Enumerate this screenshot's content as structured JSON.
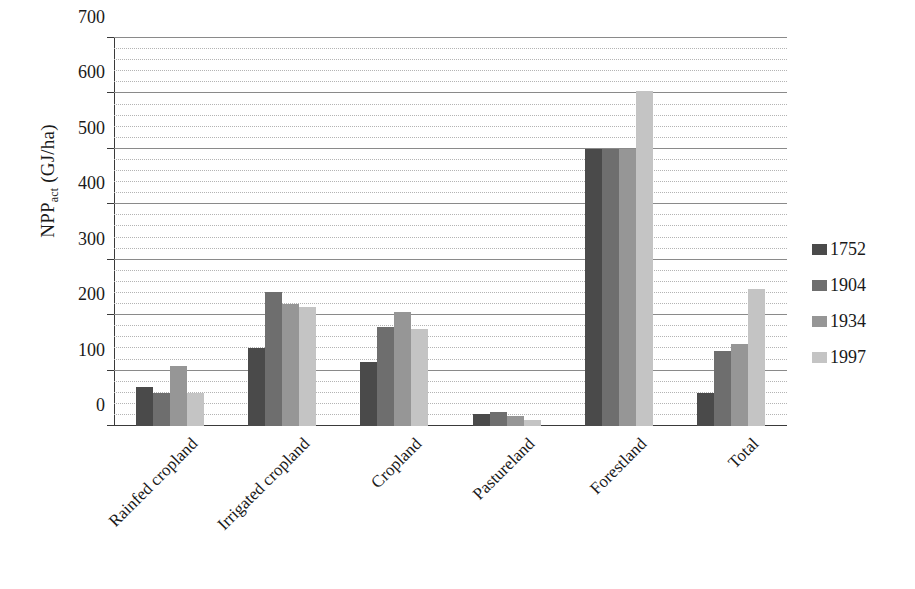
{
  "chart_data": {
    "type": "bar",
    "title": "",
    "xlabel": "",
    "ylabel": "NPPact (GJ/ha)",
    "ylabel_main": "NPP",
    "ylabel_sub": "act",
    "ylabel_units": " (GJ/ha)",
    "ylim": [
      0,
      700
    ],
    "ytick_labels": [
      "0",
      "100",
      "200",
      "300",
      "400",
      "500",
      "600",
      "700"
    ],
    "ytick_values": [
      0,
      100,
      200,
      300,
      400,
      500,
      600,
      700
    ],
    "grid": true,
    "minor_gridline_step": 20,
    "legend_position": "right",
    "categories": [
      "Rainfed cropland",
      "Irrigated cropland",
      "Cropland",
      "Pastureland",
      "Forestland",
      "Total"
    ],
    "series": [
      {
        "name": "1752",
        "color": "#4a4a4a",
        "values": [
          70,
          140,
          115,
          22,
          500,
          60
        ]
      },
      {
        "name": "1904",
        "color": "#6e6e6e",
        "values": [
          60,
          242,
          178,
          26,
          500,
          135
        ]
      },
      {
        "name": "1934",
        "color": "#969696",
        "values": [
          108,
          220,
          205,
          18,
          500,
          148
        ]
      },
      {
        "name": "1997",
        "color": "#c4c4c4",
        "values": [
          60,
          215,
          175,
          10,
          605,
          248
        ]
      }
    ]
  },
  "legend": {
    "items": [
      {
        "label": "1752",
        "color": "#4a4a4a"
      },
      {
        "label": "1904",
        "color": "#6e6e6e"
      },
      {
        "label": "1934",
        "color": "#969696"
      },
      {
        "label": "1997",
        "color": "#c4c4c4"
      }
    ]
  },
  "colors": {
    "axis": "#3a3a3a",
    "gridline_major": "#8a8a8a",
    "gridline_minor": "#b4b4b4",
    "background": "#ffffff"
  }
}
